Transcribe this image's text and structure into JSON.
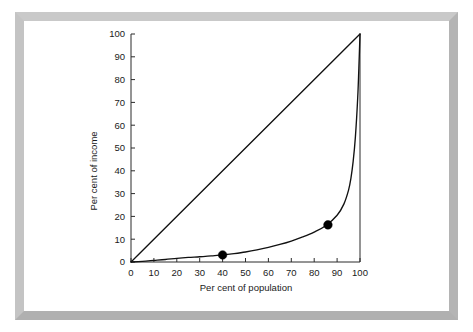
{
  "figure": {
    "frame_color": "#bcbcbc",
    "background_color": "#ffffff",
    "axis_color": "#2b2b2b",
    "curve_color": "#111111",
    "marker_color": "#000000"
  },
  "chart_data": {
    "type": "line",
    "title": "",
    "xlabel": "Per cent of population",
    "ylabel": "Per cent of income",
    "xlim": [
      0,
      100
    ],
    "ylim": [
      0,
      100
    ],
    "xticks": [
      0,
      10,
      20,
      30,
      40,
      50,
      60,
      70,
      80,
      90,
      100
    ],
    "yticks": [
      0,
      10,
      20,
      30,
      40,
      50,
      60,
      70,
      80,
      90,
      100
    ],
    "xtick_labels": [
      "0",
      "10",
      "20",
      "30",
      "40",
      "50",
      "60",
      "70",
      "80",
      "90",
      "100"
    ],
    "ytick_labels": [
      "0",
      "10",
      "20",
      "30",
      "40",
      "50",
      "60",
      "70",
      "80",
      "90",
      "100"
    ],
    "grid": false,
    "legend": null,
    "series": [
      {
        "name": "Line of equality",
        "type": "line",
        "x": [
          0,
          100
        ],
        "values": [
          0,
          100
        ]
      },
      {
        "name": "Lorenz curve",
        "type": "line",
        "x": [
          0,
          5,
          10,
          15,
          20,
          25,
          30,
          35,
          40,
          45,
          50,
          55,
          60,
          65,
          70,
          75,
          80,
          85,
          90,
          93,
          95,
          96,
          97,
          98,
          99,
          99.5,
          100
        ],
        "values": [
          0,
          0.3,
          0.7,
          1.1,
          1.6,
          2.0,
          2.3,
          2.7,
          3.1,
          3.7,
          4.4,
          5.3,
          6.4,
          7.7,
          9.2,
          11.0,
          13.1,
          15.9,
          20.5,
          25.5,
          31.5,
          36.5,
          44.0,
          55.0,
          72.0,
          85.0,
          100
        ]
      }
    ],
    "markers": [
      {
        "label": "",
        "x": 40,
        "y": 3.1
      },
      {
        "label": "",
        "x": 86,
        "y": 16.3
      }
    ]
  }
}
